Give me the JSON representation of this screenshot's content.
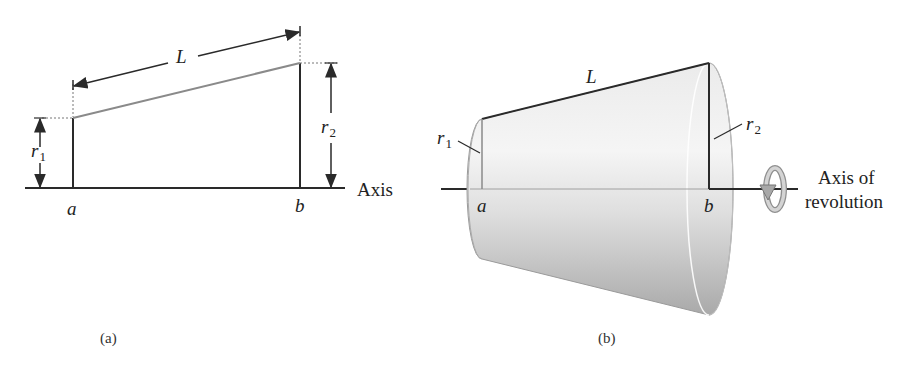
{
  "figure_a": {
    "caption": "(a)",
    "label_L": "L",
    "label_r1": "r",
    "label_r1_sub": "1",
    "label_r2": "r",
    "label_r2_sub": "2",
    "label_a": "a",
    "label_b": "b",
    "label_axis": "Axis"
  },
  "figure_b": {
    "caption": "(b)",
    "label_L": "L",
    "label_r1": "r",
    "label_r1_sub": "1",
    "label_r2": "r",
    "label_r2_sub": "2",
    "label_a": "a",
    "label_b": "b",
    "label_axis_line1": "Axis of",
    "label_axis_line2": "revolution",
    "icon": "rotation-arrow-icon"
  },
  "colors": {
    "line": "#2a2a2a",
    "slant_a": "#7a7a7a",
    "cone_light": "#f2f2f2",
    "cone_dark": "#b8b8b8"
  }
}
